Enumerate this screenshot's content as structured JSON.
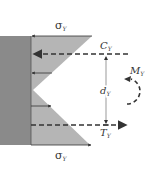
{
  "diagram": {
    "labels": {
      "sigma_top": "σ",
      "sigma_top_sub": "Y",
      "sigma_bottom": "σ",
      "sigma_bottom_sub": "Y",
      "compression": "C",
      "compression_sub": "Y",
      "tension": "T",
      "tension_sub": "Y",
      "moment": "M",
      "moment_sub": "Y",
      "lever_arm": "d",
      "lever_arm_sub": "Y"
    },
    "colors": {
      "section_fill": "#8a8a8a",
      "stress_fill": "#b5b5b5",
      "line": "#333333",
      "background": "#ffffff"
    }
  }
}
